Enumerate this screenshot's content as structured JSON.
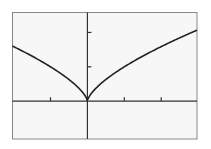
{
  "chart_data": {
    "type": "line",
    "title": "",
    "xlabel": "",
    "ylabel": "",
    "function": "y = x^(2/3)",
    "xlim": [
      -2.03,
      2.97
    ],
    "ylim": [
      -1.1,
      2.58
    ],
    "x_ticks": [
      -1,
      1,
      2
    ],
    "y_ticks": [
      1,
      2
    ],
    "grid": false,
    "legend": null,
    "series": [
      {
        "name": "y = x^(2/3)",
        "x": [
          -2.03,
          -1.5,
          -1.0,
          -0.5,
          -0.2,
          0,
          0.2,
          0.5,
          1.0,
          1.5,
          2.0,
          2.5,
          2.97
        ],
        "y": [
          1.6,
          1.31,
          1.0,
          0.63,
          0.34,
          0,
          0.34,
          0.63,
          1.0,
          1.31,
          1.59,
          1.84,
          2.07
        ]
      }
    ]
  },
  "colors": {
    "frame": "#888888",
    "axes": "#333333",
    "curve": "#222222",
    "background": "#f7f7f7"
  }
}
